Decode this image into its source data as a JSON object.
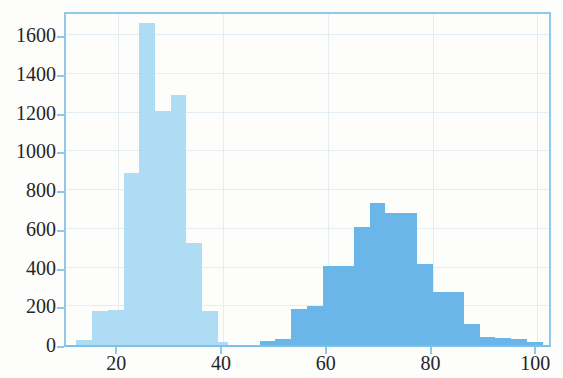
{
  "chart_data": {
    "type": "bar",
    "title": "",
    "subtitle": "",
    "xlabel": "",
    "ylabel": "",
    "xlim": [
      10,
      103
    ],
    "ylim": [
      0,
      1730
    ],
    "grid": true,
    "legend": null,
    "bin_width": 3,
    "xticks": [
      20,
      40,
      60,
      80,
      100
    ],
    "xticklabels": [
      "20",
      "40",
      "60",
      "80",
      "100"
    ],
    "yticks": [
      0,
      200,
      400,
      600,
      800,
      1000,
      1200,
      1400,
      1600
    ],
    "yticklabels": [
      "0",
      "200",
      "400",
      "600",
      "800",
      "1000",
      "1200",
      "1400",
      "1600"
    ],
    "colors": {
      "series_1": "#aedcf4",
      "series_2": "#6ab6e8",
      "axis": "#8fc9ea",
      "grid": "#e3eef4",
      "text": "#262626",
      "background": "#fdfdfb"
    },
    "series": [
      {
        "name": "series-light",
        "color": "#aedcf4",
        "bins": [
          {
            "x0": 12,
            "x1": 15,
            "value": 25
          },
          {
            "x0": 15,
            "x1": 18,
            "value": 175
          },
          {
            "x0": 18,
            "x1": 21,
            "value": 180
          },
          {
            "x0": 21,
            "x1": 24,
            "value": 890
          },
          {
            "x0": 24,
            "x1": 27,
            "value": 1665
          },
          {
            "x0": 27,
            "x1": 30,
            "value": 1210
          },
          {
            "x0": 30,
            "x1": 33,
            "value": 1290
          },
          {
            "x0": 33,
            "x1": 36,
            "value": 525
          },
          {
            "x0": 36,
            "x1": 39,
            "value": 175
          },
          {
            "x0": 39,
            "x1": 41,
            "value": 15
          }
        ]
      },
      {
        "name": "series-dark",
        "color": "#6ab6e8",
        "bins": [
          {
            "x0": 47,
            "x1": 50,
            "value": 20
          },
          {
            "x0": 50,
            "x1": 53,
            "value": 30
          },
          {
            "x0": 53,
            "x1": 56,
            "value": 185
          },
          {
            "x0": 56,
            "x1": 59,
            "value": 200
          },
          {
            "x0": 59,
            "x1": 62,
            "value": 410
          },
          {
            "x0": 62,
            "x1": 65,
            "value": 410
          },
          {
            "x0": 65,
            "x1": 68,
            "value": 610
          },
          {
            "x0": 68,
            "x1": 71,
            "value": 735
          },
          {
            "x0": 71,
            "x1": 74,
            "value": 680
          },
          {
            "x0": 74,
            "x1": 77,
            "value": 680
          },
          {
            "x0": 77,
            "x1": 80,
            "value": 420
          },
          {
            "x0": 80,
            "x1": 83,
            "value": 275
          },
          {
            "x0": 83,
            "x1": 86,
            "value": 275
          },
          {
            "x0": 86,
            "x1": 89,
            "value": 110
          },
          {
            "x0": 89,
            "x1": 92,
            "value": 40
          },
          {
            "x0": 92,
            "x1": 95,
            "value": 35
          },
          {
            "x0": 95,
            "x1": 98,
            "value": 30
          },
          {
            "x0": 98,
            "x1": 101,
            "value": 15
          }
        ]
      }
    ]
  }
}
